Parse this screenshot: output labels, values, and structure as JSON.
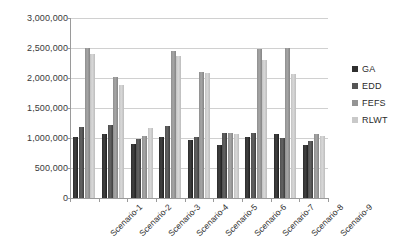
{
  "chart_data": {
    "type": "bar",
    "title": "",
    "subtitle": "",
    "xlabel": "",
    "ylabel": "",
    "ylim": [
      0,
      3000000
    ],
    "ytick_step": 500000,
    "ytick_labels": [
      "3,000,000",
      "2,500,000",
      "2,000,000",
      "1,500,000",
      "1,000,000",
      "500,000",
      "0"
    ],
    "ytick_values": [
      3000000,
      2500000,
      2000000,
      1500000,
      1000000,
      500000,
      0
    ],
    "grid": true,
    "legend_position": "right",
    "categories": [
      "Scenario-1",
      "Scenario-2",
      "Scenario-3",
      "Scenario-4",
      "Scenario-5",
      "Scenario-6",
      "Scenario-7",
      "Scenario-8",
      "Scenario-9"
    ],
    "series": [
      {
        "name": "GA",
        "color": "#2f2f2f",
        "values": [
          1020000,
          1070000,
          900000,
          1010000,
          970000,
          880000,
          1020000,
          1070000,
          880000
        ]
      },
      {
        "name": "EDD",
        "color": "#555555",
        "values": [
          1180000,
          1210000,
          980000,
          1200000,
          1020000,
          1080000,
          1090000,
          1000000,
          950000
        ]
      },
      {
        "name": "FEFS",
        "color": "#949494",
        "values": [
          2500000,
          2010000,
          1030000,
          2450000,
          2100000,
          1080000,
          2480000,
          2500000,
          1070000
        ]
      },
      {
        "name": "RLWT",
        "color": "#c9c9c9",
        "values": [
          2400000,
          1890000,
          1160000,
          2370000,
          2080000,
          1060000,
          2300000,
          2060000,
          1030000
        ]
      }
    ]
  },
  "legend": {
    "items": [
      {
        "label": "GA",
        "key": "ga"
      },
      {
        "label": "EDD",
        "key": "edd"
      },
      {
        "label": "FEFS",
        "key": "fefs"
      },
      {
        "label": "RLWT",
        "key": "rlwt"
      }
    ]
  }
}
